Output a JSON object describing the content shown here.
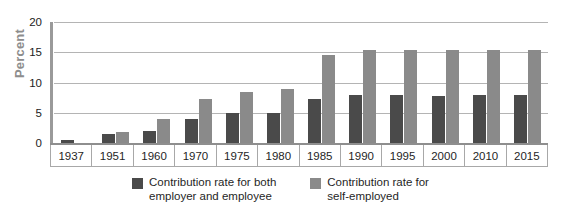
{
  "chart_data": {
    "type": "bar",
    "title": "",
    "xlabel": "",
    "ylabel": "Percent",
    "ylim": [
      0,
      20
    ],
    "yticks": [
      0,
      5,
      10,
      15,
      20
    ],
    "grid": true,
    "legend_position": "bottom",
    "categories": [
      "1937",
      "1951",
      "1960",
      "1970",
      "1975",
      "1980",
      "1985",
      "1990",
      "1995",
      "2000",
      "2010",
      "2015"
    ],
    "series": [
      {
        "name": "Contribution rate for both\nemployer and employee",
        "color": "#4a4a4a",
        "values": [
          0.5,
          1.5,
          2.0,
          4.0,
          5.0,
          5.0,
          7.3,
          7.9,
          8.0,
          7.8,
          8.0,
          8.0
        ]
      },
      {
        "name": "Contribution rate for\nself-employed",
        "color": "#8a8a8a",
        "values": [
          0.0,
          1.8,
          4.0,
          7.3,
          8.5,
          9.0,
          14.6,
          15.3,
          15.4,
          15.4,
          15.4,
          15.4
        ]
      }
    ]
  },
  "legend": {
    "items": [
      {
        "label": "Contribution rate for both\nemployer and employee",
        "color": "#4a4a4a"
      },
      {
        "label": "Contribution rate for\nself-employed",
        "color": "#8a8a8a"
      }
    ]
  }
}
